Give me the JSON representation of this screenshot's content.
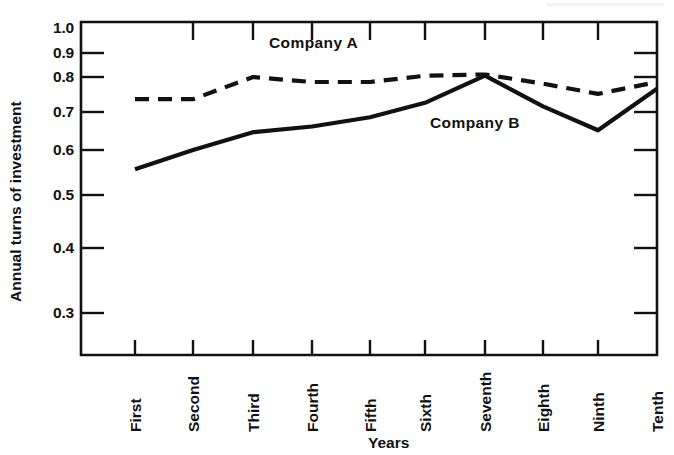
{
  "figure": {
    "background_color": "#ffffff",
    "ink_color": "#111111"
  },
  "chart_data": {
    "type": "line",
    "title": "",
    "xlabel": "Years",
    "ylabel": "Annual turns of investment",
    "categories": [
      "First",
      "Second",
      "Third",
      "Fourth",
      "Fifth",
      "Sixth",
      "Seventh",
      "Eighth",
      "Ninth",
      "Tenth"
    ],
    "yticks": [
      0.3,
      0.4,
      0.5,
      0.6,
      0.7,
      0.8,
      0.9,
      1.0
    ],
    "ytick_labels": [
      "0.3",
      "0.4",
      "0.5",
      "0.6",
      "0.7",
      "0.8",
      "0.9",
      "1.0"
    ],
    "yscale": "log",
    "ylim": [
      0.27,
      1.0
    ],
    "grid": false,
    "legend_position": "inline-annotations",
    "series": [
      {
        "name": "Company A",
        "style": "dashed",
        "color": "#111111",
        "values": [
          0.735,
          0.735,
          0.8,
          0.785,
          0.785,
          0.805,
          0.81,
          0.78,
          0.75,
          0.785
        ]
      },
      {
        "name": "Company B",
        "style": "solid",
        "color": "#111111",
        "values": [
          0.555,
          0.6,
          0.645,
          0.66,
          0.685,
          0.725,
          0.805,
          0.715,
          0.65,
          0.765
        ]
      }
    ],
    "annotations": [
      {
        "text": "Company A",
        "series": "Company A",
        "x_px": 269,
        "y_px": 42
      },
      {
        "text": "Company B",
        "series": "Company B",
        "x_px": 430,
        "y_px": 122
      }
    ]
  }
}
